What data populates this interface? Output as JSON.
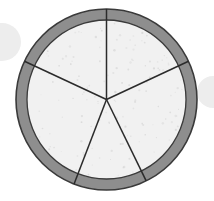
{
  "canvas": {
    "width": 214,
    "height": 201,
    "background_color": "#ffffff"
  },
  "figure": {
    "name": "pizza-fraction-circle",
    "center_x": 106.5,
    "center_y": 99.5,
    "outer_radius": 90.5,
    "inner_radius": 79.5,
    "crust_thickness": 11,
    "slice_count": 5,
    "colors": {
      "crust_fill": "#8e8e8e",
      "crust_outline": "#3a3a3a",
      "interior_fill": "#f1f1f1",
      "speckle": "#c9c9c9",
      "divider_line": "#2b2b2b",
      "background": "#ffffff",
      "ghost_arc": "#ededed"
    },
    "outline_width": 1.6,
    "divider_width": 1.5
  },
  "slices": [
    {
      "name": "slice-top-right",
      "start_angle_deg": 25,
      "end_angle_deg": 90
    },
    {
      "name": "slice-top-left",
      "start_angle_deg": 90,
      "end_angle_deg": 155
    },
    {
      "name": "slice-left",
      "start_angle_deg": 155,
      "end_angle_deg": 249
    },
    {
      "name": "slice-bottom",
      "start_angle_deg": 249,
      "end_angle_deg": 296
    },
    {
      "name": "slice-right",
      "start_angle_deg": 296,
      "end_angle_deg": 385
    }
  ],
  "dividers": [
    {
      "name": "divider-up",
      "angle_deg": 90,
      "end_x": 106.5,
      "end_y": 9.0
    },
    {
      "name": "divider-upper-left",
      "angle_deg": 155,
      "end_x": 24.5,
      "end_y": 61.3
    },
    {
      "name": "divider-upper-right",
      "angle_deg": 25,
      "end_x": 188.5,
      "end_y": 61.3
    },
    {
      "name": "divider-lower-left",
      "angle_deg": 249,
      "end_x": 74.0,
      "end_y": 173.7
    },
    {
      "name": "divider-lower-right",
      "angle_deg": 296,
      "end_x": 145.3,
      "end_y": 170.9
    }
  ],
  "ghost_arcs": [
    {
      "name": "ghost-arc-left",
      "cx": 2,
      "cy": 42,
      "r": 19
    },
    {
      "name": "ghost-arc-right",
      "cx": 213,
      "cy": 92,
      "r": 16
    }
  ],
  "speckles": {
    "count": 150,
    "radius_min": 0.5,
    "radius_max": 1.25,
    "opacity": 0.55
  }
}
